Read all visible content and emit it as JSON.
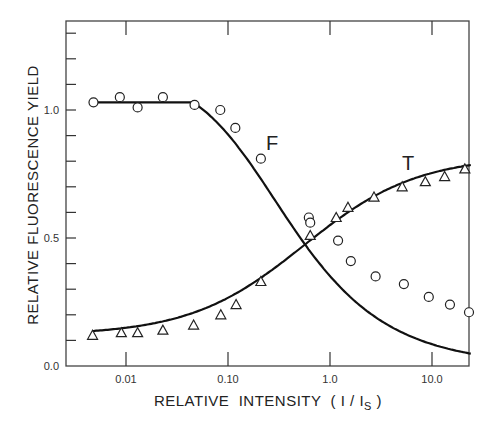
{
  "chart_data": {
    "type": "scatter",
    "title": "",
    "xlabel": "RELATIVE  INTENSITY  ( I / I",
    "xlabel_subscript": "S",
    "xlabel_close": " )",
    "ylabel": "RELATIVE  FLUORESCENCE  YIELD",
    "xscale": "log",
    "xlim": [
      0.0035,
      24
    ],
    "ylim": [
      0.0,
      1.35
    ],
    "x_ticks": [
      0.01,
      0.1,
      1.0,
      10.0
    ],
    "x_tick_labels": [
      "0.01",
      "0.10",
      "1.0",
      "10.0"
    ],
    "y_ticks": [
      0.0,
      0.5,
      1.0
    ],
    "y_tick_labels": [
      "0.0",
      "0.5",
      "1.0"
    ],
    "y_minor_step": 0.1,
    "grid": false,
    "legend": "none (curves labeled inline)",
    "series": [
      {
        "name": "F",
        "marker": "circle",
        "x": [
          0.0048,
          0.0087,
          0.013,
          0.023,
          0.047,
          0.084,
          0.118,
          0.21,
          0.62,
          0.64,
          1.2,
          1.6,
          2.8,
          5.3,
          9.3,
          15,
          24
        ],
        "y": [
          1.03,
          1.05,
          1.01,
          1.05,
          1.02,
          1.0,
          0.93,
          0.81,
          0.58,
          0.56,
          0.49,
          0.41,
          0.35,
          0.32,
          0.27,
          0.24,
          0.21
        ],
        "fit_curve": true
      },
      {
        "name": "T",
        "marker": "triangle",
        "x": [
          0.0047,
          0.009,
          0.013,
          0.023,
          0.046,
          0.085,
          0.12,
          0.21,
          0.64,
          1.15,
          1.5,
          2.7,
          5.1,
          8.6,
          13.3,
          21
        ],
        "y": [
          0.12,
          0.13,
          0.13,
          0.14,
          0.16,
          0.2,
          0.24,
          0.33,
          0.51,
          0.58,
          0.62,
          0.66,
          0.7,
          0.72,
          0.74,
          0.77
        ],
        "fit_curve": true
      }
    ],
    "annotations": [
      {
        "text": "F",
        "near": "F curve at x≈0.3, y≈0.9"
      },
      {
        "text": "T",
        "near": "T curve at x≈4, y≈0.83"
      }
    ]
  }
}
